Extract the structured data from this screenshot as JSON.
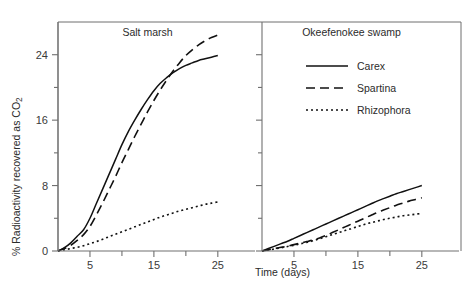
{
  "figure": {
    "background_color": "#ffffff",
    "line_color": "#111111",
    "axis_color": "#707070",
    "frame_color": "#6e6e6e"
  },
  "axes": {
    "x_title": "Time (days)",
    "y_title_main": "% Radioactivity recovered as CO",
    "y_title_subscript": "2",
    "x_ticks_major": [
      5,
      15,
      25
    ],
    "x_ticks_minor": [
      10,
      20
    ],
    "x_tick_labels": [
      "5",
      "15",
      "25"
    ],
    "y_ticks_major": [
      0,
      8,
      16,
      24
    ],
    "y_ticks_minor": [
      4,
      12,
      20
    ],
    "y_tick_labels": [
      "0",
      "8",
      "16",
      "24"
    ],
    "xlim": [
      0,
      28
    ],
    "ylim": [
      0,
      28
    ]
  },
  "legend": {
    "position": "right-panel-upper-left",
    "entries": [
      {
        "label": "Carex",
        "style": "solid",
        "dash": "none"
      },
      {
        "label": "Spartina",
        "style": "dashed",
        "dash": "9,5"
      },
      {
        "label": "Rhizophora",
        "style": "dotted",
        "dash": "2,3"
      }
    ]
  },
  "chart_data": {
    "type": "line",
    "title": "",
    "xlabel": "Time (days)",
    "ylabel": "% Radioactivity recovered as CO2",
    "xlim": [
      0,
      28
    ],
    "ylim": [
      0,
      28
    ],
    "grid": false,
    "legend_position": "upper-left of right panel",
    "panels": [
      {
        "name": "salt-marsh",
        "title": "Salt marsh",
        "x": [
          0,
          1,
          2,
          3,
          4,
          5,
          6,
          7,
          8,
          9,
          10,
          11,
          12,
          13,
          14,
          15,
          16,
          17,
          18,
          19,
          20,
          21,
          22,
          23,
          24,
          25
        ],
        "series": [
          {
            "name": "Carex",
            "style": "solid",
            "values": [
              0,
              0.4,
              1.0,
              1.8,
              2.6,
              4.0,
              5.8,
              7.6,
              9.4,
              11.2,
              13.0,
              14.6,
              16.0,
              17.3,
              18.5,
              19.6,
              20.5,
              21.2,
              21.8,
              22.3,
              22.7,
              23.0,
              23.3,
              23.5,
              23.7,
              23.9
            ]
          },
          {
            "name": "Spartina",
            "style": "dashed",
            "values": [
              0,
              0.3,
              0.7,
              1.3,
              2.0,
              3.0,
              4.4,
              5.9,
              7.5,
              9.1,
              10.8,
              12.4,
              14.0,
              15.5,
              17.0,
              18.4,
              19.7,
              20.9,
              22.0,
              23.0,
              23.9,
              24.6,
              25.2,
              25.7,
              26.1,
              26.4
            ]
          },
          {
            "name": "Rhizophora",
            "style": "dotted",
            "values": [
              0,
              0.15,
              0.3,
              0.45,
              0.65,
              0.9,
              1.15,
              1.45,
              1.75,
              2.05,
              2.35,
              2.65,
              2.95,
              3.25,
              3.55,
              3.85,
              4.15,
              4.4,
              4.65,
              4.9,
              5.1,
              5.3,
              5.5,
              5.7,
              5.85,
              6.0
            ]
          }
        ]
      },
      {
        "name": "okeefenokee-swamp",
        "title": "Okeefenokee swamp",
        "x": [
          0,
          1,
          2,
          3,
          4,
          5,
          6,
          7,
          8,
          9,
          10,
          11,
          12,
          13,
          14,
          15,
          16,
          17,
          18,
          19,
          20,
          21,
          22,
          23,
          24,
          25
        ],
        "series": [
          {
            "name": "Carex",
            "style": "solid",
            "values": [
              0,
              0.3,
              0.6,
              0.9,
              1.2,
              1.55,
              1.9,
              2.25,
              2.6,
              2.95,
              3.3,
              3.65,
              4.0,
              4.35,
              4.7,
              5.05,
              5.4,
              5.75,
              6.1,
              6.4,
              6.7,
              7.0,
              7.25,
              7.5,
              7.75,
              8.0
            ]
          },
          {
            "name": "Spartina",
            "style": "dashed",
            "values": [
              0,
              0.15,
              0.3,
              0.45,
              0.6,
              0.78,
              0.96,
              1.15,
              1.35,
              1.6,
              1.9,
              2.25,
              2.6,
              2.95,
              3.3,
              3.65,
              4.0,
              4.35,
              4.7,
              5.0,
              5.3,
              5.6,
              5.85,
              6.1,
              6.3,
              6.5
            ]
          },
          {
            "name": "Rhizophora",
            "style": "dotted",
            "values": [
              0,
              0.12,
              0.25,
              0.4,
              0.55,
              0.7,
              0.88,
              1.05,
              1.25,
              1.5,
              1.75,
              2.0,
              2.25,
              2.5,
              2.75,
              3.0,
              3.25,
              3.45,
              3.65,
              3.85,
              4.0,
              4.15,
              4.3,
              4.4,
              4.5,
              4.6
            ]
          }
        ]
      }
    ]
  }
}
